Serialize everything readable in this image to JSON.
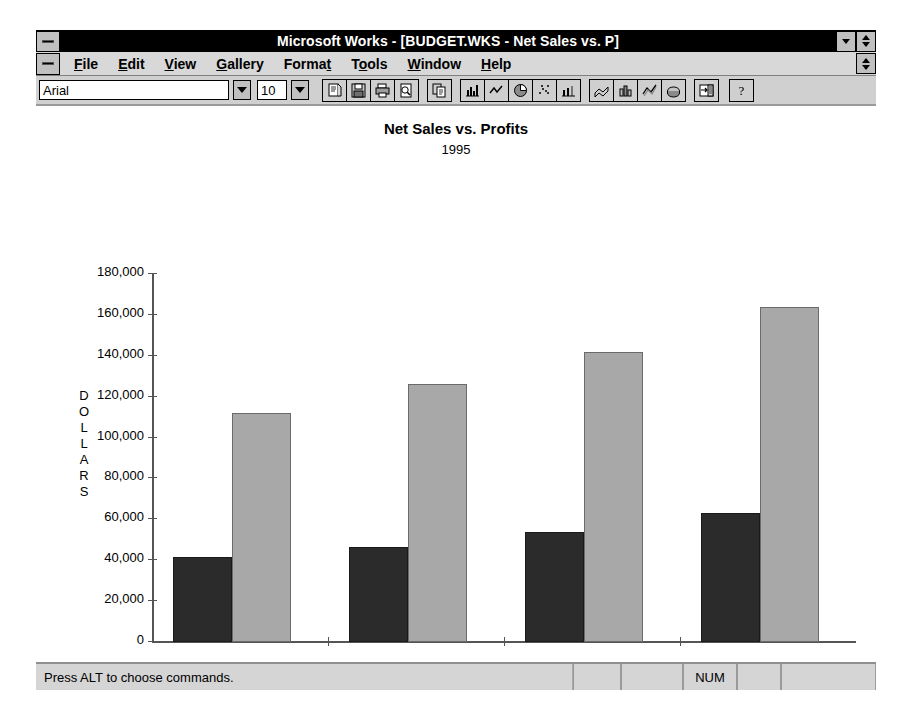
{
  "window": {
    "title": "Microsoft Works - [BUDGET.WKS - Net Sales vs. P]",
    "sys_menu_icon": "system-menu-icon",
    "doc_sys_menu_icon": "document-system-menu-icon",
    "restore_icon": "restore-down-icon",
    "minmax_icon": "minimize-maximize-icon"
  },
  "menubar": {
    "items": [
      {
        "label": "File",
        "pre": "",
        "key": "F",
        "post": "ile"
      },
      {
        "label": "Edit",
        "pre": "",
        "key": "E",
        "post": "dit"
      },
      {
        "label": "View",
        "pre": "",
        "key": "V",
        "post": "iew"
      },
      {
        "label": "Gallery",
        "pre": "",
        "key": "G",
        "post": "allery"
      },
      {
        "label": "Format",
        "pre": "Forma",
        "key": "t",
        "post": ""
      },
      {
        "label": "Tools",
        "pre": "T",
        "key": "o",
        "post": "ols"
      },
      {
        "label": "Window",
        "pre": "",
        "key": "W",
        "post": "indow"
      },
      {
        "label": "Help",
        "pre": "",
        "key": "H",
        "post": "elp"
      }
    ]
  },
  "toolbar": {
    "font_name": "Arial",
    "font_size": "10",
    "font_dropdown_icon": "chevron-down-icon",
    "size_dropdown_icon": "chevron-down-icon",
    "buttons": [
      {
        "name": "new-document-icon"
      },
      {
        "name": "save-icon"
      },
      {
        "name": "print-icon"
      },
      {
        "name": "print-preview-icon"
      },
      {
        "name": "copy-icon"
      },
      {
        "name": "bar-chart-icon"
      },
      {
        "name": "line-chart-icon"
      },
      {
        "name": "pie-chart-icon"
      },
      {
        "name": "scatter-chart-icon"
      },
      {
        "name": "combo-chart-icon"
      },
      {
        "name": "area-chart-3d-icon"
      },
      {
        "name": "bar-chart-3d-icon"
      },
      {
        "name": "line-chart-3d-icon"
      },
      {
        "name": "pie-chart-3d-icon"
      },
      {
        "name": "insert-chart-icon"
      },
      {
        "name": "help-icon"
      }
    ]
  },
  "statusbar": {
    "message": "Press ALT to choose commands.",
    "segments": [
      "",
      "",
      "NUM",
      "",
      ""
    ]
  },
  "chart_data": {
    "type": "bar",
    "title": "Net Sales vs. Profits",
    "subtitle": "1995",
    "xlabel": "QUARTER",
    "ylabel": "DOLLARS",
    "categories": [
      "Q1",
      "Q2",
      "Q3",
      "Q4"
    ],
    "series": [
      {
        "name": "Gross Profits",
        "color": "#2b2b2b",
        "values": [
          41000,
          46000,
          53500,
          62500
        ]
      },
      {
        "name": "Net Sales",
        "color": "#a8a8a8",
        "values": [
          111500,
          125500,
          141500,
          163500
        ]
      }
    ],
    "ylim": [
      0,
      180000
    ],
    "ytick_values": [
      0,
      20000,
      40000,
      60000,
      80000,
      100000,
      120000,
      140000,
      160000,
      180000
    ],
    "ytick_labels": [
      "0",
      "20,000",
      "40,000",
      "60,000",
      "80,000",
      "100,000",
      "120,000",
      "140,000",
      "160,000",
      "180,000"
    ],
    "grid": false,
    "legend_position": "bottom"
  }
}
